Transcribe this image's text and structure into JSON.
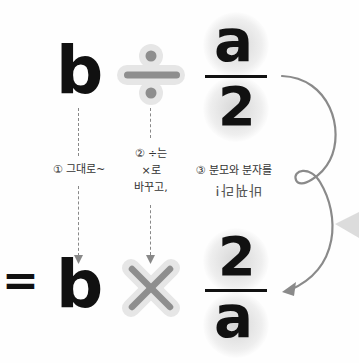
{
  "equation_top": {
    "left_operand": "b",
    "operator": "÷",
    "fraction": {
      "numerator": "a",
      "denominator": "2"
    }
  },
  "equation_bottom": {
    "equals": "=",
    "left_operand": "b",
    "operator": "×",
    "fraction": {
      "numerator": "2",
      "denominator": "a"
    }
  },
  "annotations": {
    "step1": "① 그대로~",
    "step2_line1": "② ÷는",
    "step2_line2": "×로",
    "step2_line3": "바꾸고,",
    "step3_line1": "③ 분모와 분자를",
    "step3_line2": "바꿔라!"
  },
  "colors": {
    "ink": "#111111",
    "operator_gray": "#888888",
    "operator_halo": "#e6e6e6",
    "arrow_gray": "#8a8a8a",
    "pointer_triangle": "#dcdcdc"
  }
}
